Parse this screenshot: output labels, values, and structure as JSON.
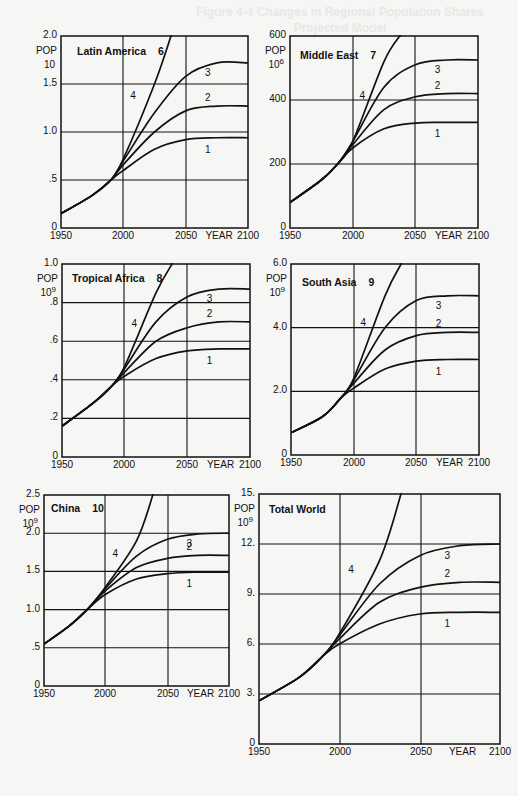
{
  "page": {
    "bleed_text_1": "Figure 4-4 Changes in Regional Population Shares",
    "bleed_text_2": "Projected Model"
  },
  "axis_common": {
    "pop_label": "POP",
    "year_label": "YEAR",
    "x_ticks": [
      "1950",
      "2000",
      "2050",
      "2100"
    ]
  },
  "chart_data": [
    {
      "type": "line",
      "title": "Latin America",
      "number": "6",
      "ylabel": "POP",
      "yunit_base": "10",
      "yunit_exp": "",
      "xlabel": "YEAR",
      "x_ticks": [
        "1950",
        "2000",
        "2050",
        "2100"
      ],
      "y_ticks": [
        "0",
        ".5",
        "1.0",
        "1.5",
        "2.0"
      ],
      "ylim": [
        0,
        2.0
      ],
      "xlim": [
        1950,
        2100
      ],
      "grid": true,
      "x": [
        1950,
        1975,
        1990,
        2000,
        2025,
        2050,
        2075,
        2100
      ],
      "series": [
        {
          "name": "1",
          "values": [
            0.15,
            0.34,
            0.5,
            0.6,
            0.82,
            0.92,
            0.94,
            0.94
          ]
        },
        {
          "name": "2",
          "values": [
            0.15,
            0.34,
            0.5,
            0.66,
            1.0,
            1.22,
            1.27,
            1.27
          ]
        },
        {
          "name": "3",
          "values": [
            0.15,
            0.34,
            0.5,
            0.7,
            1.2,
            1.58,
            1.72,
            1.72
          ]
        },
        {
          "name": "4",
          "values": [
            0.15,
            0.34,
            0.5,
            0.72,
            1.5,
            2.0,
            null,
            null
          ]
        }
      ]
    },
    {
      "type": "line",
      "title": "Middle East",
      "number": "7",
      "ylabel": "POP",
      "yunit_base": "10",
      "yunit_exp": "6",
      "xlabel": "YEAR",
      "x_ticks": [
        "1950",
        "2000",
        "2050",
        "2100"
      ],
      "y_ticks": [
        "0",
        "200",
        "400",
        "600"
      ],
      "ylim": [
        0,
        600
      ],
      "xlim": [
        1950,
        2100
      ],
      "grid": true,
      "x": [
        1950,
        1975,
        1988,
        2000,
        2025,
        2050,
        2075,
        2100
      ],
      "series": [
        {
          "name": "1",
          "values": [
            80,
            150,
            200,
            250,
            310,
            328,
            330,
            330
          ]
        },
        {
          "name": "2",
          "values": [
            80,
            150,
            200,
            260,
            370,
            410,
            420,
            420
          ]
        },
        {
          "name": "3",
          "values": [
            80,
            150,
            200,
            270,
            440,
            510,
            525,
            525
          ]
        },
        {
          "name": "4",
          "values": [
            80,
            150,
            200,
            270,
            520,
            600,
            null,
            null
          ]
        }
      ]
    },
    {
      "type": "line",
      "title": "Tropical Africa",
      "number": "8",
      "ylabel": "POP",
      "yunit_base": "10",
      "yunit_exp": "9",
      "xlabel": "YEAR",
      "x_ticks": [
        "1950",
        "2000",
        "2050",
        "2100"
      ],
      "y_ticks": [
        "0",
        ".2",
        ".4",
        ".6",
        ".8",
        "1.0"
      ],
      "ylim": [
        0,
        1.0
      ],
      "xlim": [
        1950,
        2100
      ],
      "grid": true,
      "x": [
        1950,
        1975,
        1990,
        2000,
        2025,
        2050,
        2075,
        2100
      ],
      "series": [
        {
          "name": "1",
          "values": [
            0.16,
            0.28,
            0.37,
            0.42,
            0.51,
            0.55,
            0.56,
            0.56
          ]
        },
        {
          "name": "2",
          "values": [
            0.16,
            0.28,
            0.37,
            0.44,
            0.6,
            0.67,
            0.7,
            0.7
          ]
        },
        {
          "name": "3",
          "values": [
            0.16,
            0.28,
            0.37,
            0.46,
            0.7,
            0.83,
            0.87,
            0.87
          ]
        },
        {
          "name": "4",
          "values": [
            0.16,
            0.28,
            0.37,
            0.47,
            0.85,
            1.0,
            null,
            null
          ]
        }
      ]
    },
    {
      "type": "line",
      "title": "South Asia",
      "number": "9",
      "ylabel": "POP",
      "yunit_base": "10",
      "yunit_exp": "9",
      "xlabel": "YEAR",
      "x_ticks": [
        "1950",
        "2000",
        "2050",
        "2100"
      ],
      "y_ticks": [
        "0",
        "2.0",
        "4.0",
        "6.0"
      ],
      "ylim": [
        0,
        6.0
      ],
      "xlim": [
        1950,
        2100
      ],
      "grid": true,
      "x": [
        1950,
        1975,
        1990,
        2000,
        2025,
        2050,
        2075,
        2100
      ],
      "series": [
        {
          "name": "1",
          "values": [
            0.7,
            1.2,
            1.8,
            2.1,
            2.7,
            2.95,
            3.0,
            3.0
          ]
        },
        {
          "name": "2",
          "values": [
            0.7,
            1.2,
            1.8,
            2.25,
            3.3,
            3.75,
            3.85,
            3.85
          ]
        },
        {
          "name": "3",
          "values": [
            0.7,
            1.2,
            1.8,
            2.35,
            4.0,
            4.85,
            5.0,
            5.0
          ]
        },
        {
          "name": "4",
          "values": [
            0.7,
            1.2,
            1.8,
            2.4,
            5.0,
            6.0,
            null,
            null
          ]
        }
      ]
    },
    {
      "type": "line",
      "title": "China",
      "number": "10",
      "ylabel": "POP",
      "yunit_base": "10",
      "yunit_exp": "9",
      "xlabel": "YEAR",
      "x_ticks": [
        "1950",
        "2000",
        "2050",
        "2100"
      ],
      "y_ticks": [
        "0",
        ".5",
        "1.0",
        "1.5",
        "2.0",
        "2.5"
      ],
      "ylim": [
        0,
        2.5
      ],
      "xlim": [
        1950,
        2100
      ],
      "grid": true,
      "x": [
        1950,
        1970,
        1985,
        2000,
        2025,
        2050,
        2075,
        2100
      ],
      "series": [
        {
          "name": "1",
          "values": [
            0.55,
            0.78,
            1.0,
            1.2,
            1.4,
            1.47,
            1.49,
            1.49
          ]
        },
        {
          "name": "2",
          "values": [
            0.55,
            0.78,
            1.0,
            1.25,
            1.55,
            1.67,
            1.71,
            1.71
          ]
        },
        {
          "name": "3",
          "values": [
            0.55,
            0.78,
            1.0,
            1.28,
            1.7,
            1.92,
            1.99,
            2.0
          ]
        },
        {
          "name": "4",
          "values": [
            0.55,
            0.78,
            1.0,
            1.3,
            1.9,
            2.5,
            null,
            null
          ]
        }
      ]
    },
    {
      "type": "line",
      "title": "Total World",
      "number": "",
      "ylabel": "POP",
      "yunit_base": "10",
      "yunit_exp": "9",
      "xlabel": "YEAR",
      "x_ticks": [
        "1950",
        "2000",
        "2050",
        "2100"
      ],
      "y_ticks": [
        "0",
        "3.",
        "6.",
        "9.",
        "12.",
        "15."
      ],
      "ylim": [
        0,
        15
      ],
      "xlim": [
        1950,
        2100
      ],
      "grid": true,
      "x": [
        1950,
        1975,
        1990,
        2000,
        2025,
        2050,
        2075,
        2100
      ],
      "series": [
        {
          "name": "1",
          "values": [
            2.6,
            4.0,
            5.3,
            6.0,
            7.2,
            7.8,
            7.9,
            7.9
          ]
        },
        {
          "name": "2",
          "values": [
            2.6,
            4.0,
            5.3,
            6.3,
            8.5,
            9.4,
            9.7,
            9.7
          ]
        },
        {
          "name": "3",
          "values": [
            2.6,
            4.0,
            5.3,
            6.5,
            9.6,
            11.3,
            11.9,
            12.0
          ]
        },
        {
          "name": "4",
          "values": [
            2.6,
            4.0,
            5.3,
            6.6,
            11.0,
            15.0,
            null,
            null
          ]
        }
      ]
    }
  ]
}
